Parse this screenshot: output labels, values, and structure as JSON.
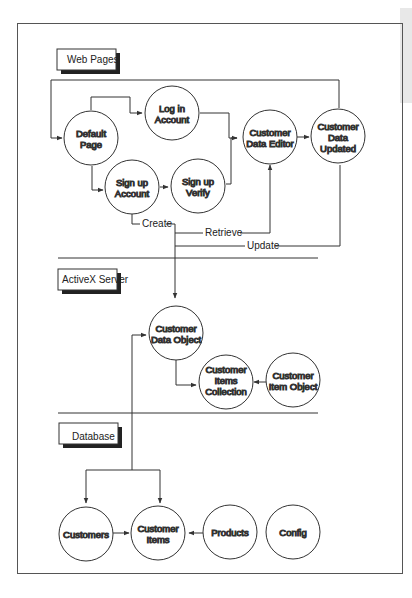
{
  "sections": {
    "web_pages": "Web Pages",
    "activex_server": "ActiveX Server",
    "database": "Database"
  },
  "nodes": {
    "default_page": [
      "Default",
      "Page"
    ],
    "log_in_account": [
      "Log in",
      "Account"
    ],
    "sign_up_account": [
      "Sign up",
      "Account"
    ],
    "sign_up_verify": [
      "Sign up",
      "Verify"
    ],
    "customer_data_editor": [
      "Customer",
      "Data Editor"
    ],
    "customer_data_updated": [
      "Customer",
      "Data",
      "Updated"
    ],
    "customer_data_object": [
      "Customer",
      "Data Object"
    ],
    "customer_items_collection": [
      "Customer",
      "Items",
      "Collection"
    ],
    "customer_item_object": [
      "Customer",
      "Item Object"
    ],
    "customers": [
      "Customers"
    ],
    "customer_items": [
      "Customer",
      "Items"
    ],
    "products": [
      "Products"
    ],
    "config": [
      "Config"
    ]
  },
  "edge_labels": {
    "create": "Create",
    "retrieve": "Retrieve",
    "update": "Update"
  },
  "colors": {
    "stroke": "#333333",
    "background": "#ffffff",
    "margin_grey": "#e8e8e8"
  }
}
